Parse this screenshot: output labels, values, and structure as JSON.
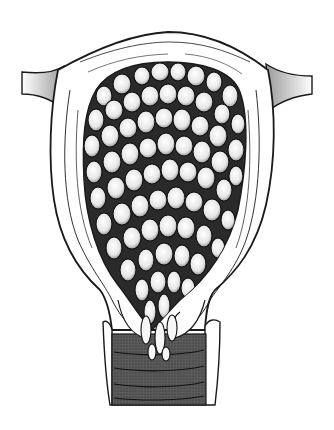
{
  "figure": {
    "style": "black-and-white line drawing",
    "colors": {
      "background": "#ffffff",
      "ink": "#1a1a1a",
      "shade": "#8a8a8a",
      "dark_fill": "#3a3a3a",
      "vesicle_fill": "#f4f4f4"
    },
    "parts": [
      "fallopian-tube-left",
      "fallopian-tube-right",
      "uterine-wall",
      "uterine-cavity-vesicles",
      "cervix",
      "vaginal-canal"
    ]
  }
}
